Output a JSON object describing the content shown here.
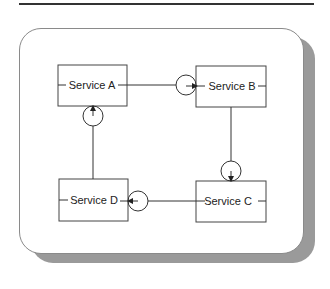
{
  "diagram": {
    "type": "service-interaction",
    "services": [
      {
        "id": "A",
        "label": "Service A"
      },
      {
        "id": "B",
        "label": "Service B"
      },
      {
        "id": "C",
        "label": "Service C"
      },
      {
        "id": "D",
        "label": "Service D"
      }
    ],
    "connections": [
      {
        "from": "Service A",
        "to": "Service B",
        "direction": "right"
      },
      {
        "from": "Service B",
        "to": "Service C",
        "direction": "down"
      },
      {
        "from": "Service C",
        "to": "Service D",
        "direction": "left"
      },
      {
        "from": "Service D",
        "to": "Service A",
        "direction": "up"
      }
    ],
    "colors": {
      "line": "#333333",
      "panel_border": "#8a8a8a",
      "shadow": "#9a9a9a",
      "background": "#ffffff"
    }
  }
}
